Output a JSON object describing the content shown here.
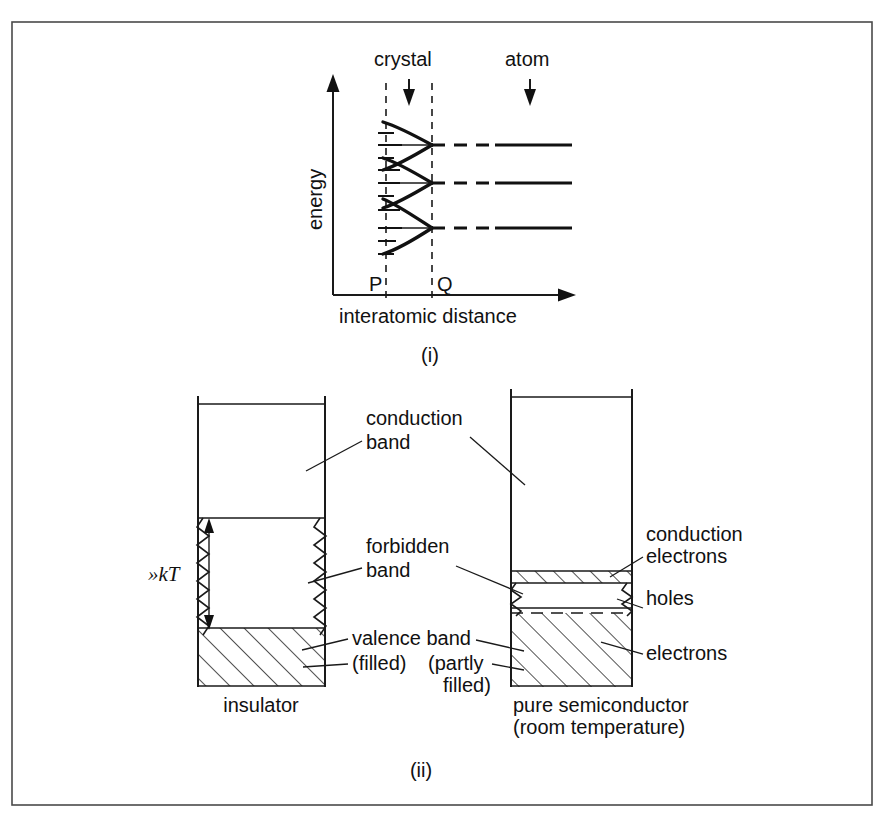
{
  "figure": {
    "panels": [
      {
        "id": "i",
        "caption": "(i)",
        "axis": {
          "y_label": "energy",
          "x_label": "interatomic distance",
          "markers": [
            "P",
            "Q"
          ]
        },
        "annotations": [
          {
            "label": "crystal"
          },
          {
            "label": "atom"
          }
        ],
        "band_count": 3
      },
      {
        "id": "ii",
        "caption": "(ii)",
        "left_diagram": {
          "name": "insulator",
          "gap_label": "»kT",
          "bands": [
            {
              "label": "conduction band",
              "fill": "empty"
            },
            {
              "label": "forbidden band",
              "fill": "gap"
            },
            {
              "label": "valence band",
              "sublabel": "(filled)",
              "fill": "hatched"
            }
          ]
        },
        "right_diagram": {
          "name": "pure semiconductor",
          "name_line2": "(room temperature)",
          "bands": [
            {
              "label": "conduction band",
              "fill": "empty"
            },
            {
              "label": "conduction electrons",
              "fill": "hatched-thin"
            },
            {
              "label": "holes",
              "fill": "gap"
            },
            {
              "label": "electrons",
              "sublabel": "(partly filled)",
              "fill": "hatched"
            }
          ]
        },
        "center_labels": [
          "conduction",
          "band",
          "forbidden",
          "band",
          "valence band",
          "(filled)",
          "(partly",
          "filled)"
        ],
        "right_labels": [
          "conduction",
          "electrons",
          "holes",
          "electrons"
        ]
      }
    ],
    "colors": {
      "ink": "#111111",
      "border": "#4a4a4a",
      "background": "#ffffff"
    }
  },
  "labels": {
    "crystal": "crystal",
    "atom": "atom",
    "energy": "energy",
    "interatomic_distance": "interatomic distance",
    "P": "P",
    "Q": "Q",
    "caption_i": "(i)",
    "caption_ii": "(ii)",
    "conduction": "conduction",
    "band": "band",
    "forbidden": "forbidden",
    "band2": "band",
    "valence_band": "valence band",
    "filled": "(filled)",
    "partly": "(partly",
    "filled2": "filled)",
    "insulator": "insulator",
    "pure_semiconductor": "pure semiconductor",
    "room_temperature": "(room temperature)",
    "conduction_electrons_1": "conduction",
    "conduction_electrons_2": "electrons",
    "holes": "holes",
    "electrons": "electrons",
    "kT": "»kT"
  }
}
